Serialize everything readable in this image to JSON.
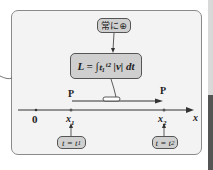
{
  "diagram": {
    "annotation_top": "常に⊕",
    "equation": "L = ∫ₜ₁ᵗ² |v| dt",
    "equation_parts": {
      "lhs": "L",
      "lower": "t1",
      "upper": "t2",
      "integrand": "|v| dt"
    },
    "axis": {
      "origin_label": "0",
      "axis_label": "x",
      "points": [
        {
          "label": "x",
          "sub": "1",
          "point_label": "P",
          "time_label": "t = t",
          "time_sub": "1"
        },
        {
          "label": "x",
          "sub": "2",
          "point_label": "P",
          "time_label": "t = t",
          "time_sub": "2"
        }
      ]
    },
    "colors": {
      "box_fill": "#cfcfcf",
      "frame_fill": "#f3f3f3",
      "line": "#333333"
    }
  }
}
